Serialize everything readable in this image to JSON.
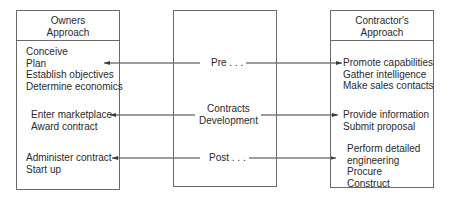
{
  "owners": {
    "title": [
      "Owners",
      "Approach"
    ],
    "groups": [
      [
        "Conceive",
        "Plan",
        "Establish objectives",
        "Determine economics"
      ],
      [
        "Enter marketplace",
        "Award contract"
      ],
      [
        "Administer contract",
        "Start up"
      ]
    ]
  },
  "middle": {
    "phases": [
      [
        "Pre . . ."
      ],
      [
        "Contracts",
        "Development"
      ],
      [
        "Post . . ."
      ]
    ]
  },
  "contractor": {
    "title": [
      "Contractor's",
      "Approach"
    ],
    "groups": [
      [
        "Promote capabilities",
        "Gather intelligence",
        "Make sales contacts"
      ],
      [
        "Provide information",
        "Submit proposal"
      ],
      [
        "Perform detailed",
        "engineering",
        "Procure",
        "Construct"
      ]
    ]
  },
  "colors": {
    "line": "#3a3a3a",
    "border": "#6a6a6a",
    "text": "#2a2a2a"
  }
}
